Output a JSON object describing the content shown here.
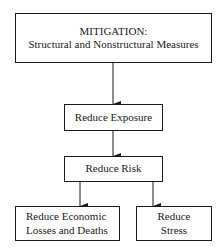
{
  "diagram": {
    "type": "flowchart",
    "nodes": [
      {
        "id": "mitigation",
        "lines": [
          "MITIGATION:",
          "Structural and Nonstructural Measures"
        ]
      },
      {
        "id": "exposure",
        "lines": [
          "Reduce Exposure"
        ]
      },
      {
        "id": "risk",
        "lines": [
          "Reduce Risk"
        ]
      },
      {
        "id": "economic",
        "lines": [
          "Reduce Economic",
          "Losses and Deaths"
        ]
      },
      {
        "id": "stress",
        "lines": [
          "Reduce",
          "Stress"
        ]
      }
    ],
    "edges": [
      {
        "from": "mitigation",
        "to": "exposure"
      },
      {
        "from": "exposure",
        "to": "risk"
      },
      {
        "from": "risk",
        "to": "economic"
      },
      {
        "from": "risk",
        "to": "stress"
      }
    ],
    "colors": {
      "line": "#1a1a1a",
      "background": "#ffffff"
    }
  }
}
